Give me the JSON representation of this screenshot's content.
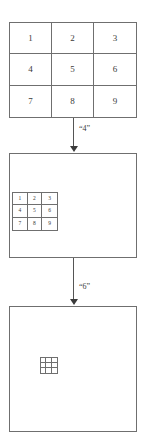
{
  "diagram": {
    "line_color": "#6f6f6f",
    "text_color": "#3a3a3a",
    "arrow_color": "#3b3b3b",
    "background": "#ffffff"
  },
  "grid_top": {
    "name": "top-numbered-grid",
    "rows": 3,
    "cols": 3,
    "cells": [
      "1",
      "2",
      "3",
      "4",
      "5",
      "6",
      "7",
      "8",
      "9"
    ]
  },
  "grid_middle": {
    "name": "middle-numbered-grid",
    "rows": 3,
    "cols": 3,
    "cells": [
      "1",
      "2",
      "3",
      "4",
      "5",
      "6",
      "7",
      "8",
      "9"
    ]
  },
  "grid_bottom": {
    "name": "bottom-blank-grid",
    "rows": 3,
    "cols": 3,
    "cells": [
      "",
      "",
      "",
      "",
      "",
      "",
      "",
      "",
      ""
    ]
  },
  "arrows": [
    {
      "name": "arrow-top-to-middle",
      "label": "“4”",
      "direction": "down"
    },
    {
      "name": "arrow-middle-to-bottom",
      "label": "“6”",
      "direction": "down"
    }
  ],
  "boxes": [
    {
      "name": "middle-outer-box",
      "label": ""
    },
    {
      "name": "bottom-outer-box",
      "label": ""
    }
  ]
}
